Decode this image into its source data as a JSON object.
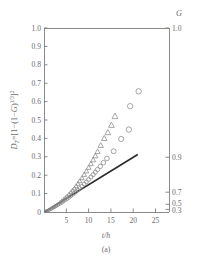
{
  "figure": {
    "caption": "(a)",
    "right_axis_title": "G",
    "xlabel": "t/h",
    "ylabel_parts": {
      "dt": "D",
      "dt_sub": "T",
      "eq": "=[1−(1−",
      "g": "G",
      "close": ")",
      "exp": "1/3",
      "tail": "]",
      "sq": "2"
    },
    "ylabel_plain": "D_T=[1-(1-G)^1/3]^2"
  },
  "chart_data": {
    "type": "scatter",
    "title": "",
    "subtitle": "",
    "caption": "(a)",
    "xlabel": "t/h",
    "ylabel": "D_T=[1-(1-G)^1/3]^2",
    "ylabel_right": "G",
    "grid": false,
    "legend": "none",
    "xlim": [
      0,
      28
    ],
    "ylim": [
      0,
      1.0
    ],
    "xticks": [
      5,
      10,
      15,
      20,
      25
    ],
    "xtick_labels": [
      "5",
      "10",
      "15",
      "20",
      "25"
    ],
    "yticks": [
      0,
      0.1,
      0.2,
      0.3,
      0.4,
      0.5,
      0.6,
      0.7,
      0.8,
      0.9,
      1.0
    ],
    "ytick_labels": [
      "0",
      "0.1",
      "0.2",
      "0.3",
      "0.4",
      "0.5",
      "0.6",
      "0.7",
      "0.8",
      "0.9",
      "1.0"
    ],
    "right_axis": {
      "label": "G",
      "tick_labels": [
        "1.0",
        "0.9",
        "0.7",
        "0.5",
        "0.3"
      ],
      "tick_G_values": [
        1.0,
        0.9,
        0.7,
        0.5,
        0.3
      ],
      "tick_DT_values": [
        1.0,
        0.2977,
        0.1077,
        0.0416,
        0.0142
      ],
      "note": "right axis is nonlinear: DT = [1-(1-G)^(1/3)]^2"
    },
    "series": [
      {
        "name": "triangles",
        "marker": "triangle-up",
        "filled": false,
        "color": "#8a8a8a",
        "points": [
          [
            0.4,
            0.004
          ],
          [
            0.8,
            0.008
          ],
          [
            1.2,
            0.013
          ],
          [
            1.6,
            0.019
          ],
          [
            2.0,
            0.025
          ],
          [
            2.4,
            0.031
          ],
          [
            2.8,
            0.038
          ],
          [
            3.2,
            0.045
          ],
          [
            3.6,
            0.053
          ],
          [
            4.0,
            0.061
          ],
          [
            4.4,
            0.069
          ],
          [
            4.8,
            0.078
          ],
          [
            5.2,
            0.087
          ],
          [
            5.6,
            0.097
          ],
          [
            6.0,
            0.107
          ],
          [
            6.4,
            0.118
          ],
          [
            6.8,
            0.129
          ],
          [
            7.2,
            0.141
          ],
          [
            7.6,
            0.154
          ],
          [
            8.0,
            0.168
          ],
          [
            8.5,
            0.185
          ],
          [
            9.0,
            0.203
          ],
          [
            9.5,
            0.222
          ],
          [
            10.0,
            0.242
          ],
          [
            10.5,
            0.262
          ],
          [
            11.0,
            0.283
          ],
          [
            11.5,
            0.305
          ],
          [
            12.0,
            0.328
          ],
          [
            12.7,
            0.362
          ],
          [
            13.5,
            0.4
          ],
          [
            14.3,
            0.432
          ],
          [
            15.1,
            0.472
          ],
          [
            15.9,
            0.52
          ]
        ]
      },
      {
        "name": "circles",
        "marker": "circle",
        "filled": false,
        "color": "#8a8a8a",
        "points": [
          [
            0.4,
            0.003
          ],
          [
            0.8,
            0.007
          ],
          [
            1.2,
            0.011
          ],
          [
            1.6,
            0.016
          ],
          [
            2.0,
            0.021
          ],
          [
            2.4,
            0.026
          ],
          [
            2.8,
            0.032
          ],
          [
            3.2,
            0.038
          ],
          [
            3.6,
            0.044
          ],
          [
            4.0,
            0.05
          ],
          [
            4.4,
            0.057
          ],
          [
            4.8,
            0.064
          ],
          [
            5.2,
            0.071
          ],
          [
            5.6,
            0.078
          ],
          [
            6.0,
            0.086
          ],
          [
            6.4,
            0.094
          ],
          [
            6.8,
            0.102
          ],
          [
            7.2,
            0.11
          ],
          [
            7.6,
            0.119
          ],
          [
            8.0,
            0.128
          ],
          [
            8.5,
            0.14
          ],
          [
            9.0,
            0.152
          ],
          [
            9.5,
            0.164
          ],
          [
            10.0,
            0.177
          ],
          [
            10.5,
            0.19
          ],
          [
            11.0,
            0.203
          ],
          [
            11.5,
            0.217
          ],
          [
            12.0,
            0.231
          ],
          [
            12.6,
            0.248
          ],
          [
            13.3,
            0.268
          ],
          [
            14.1,
            0.291
          ],
          [
            15.6,
            0.33
          ],
          [
            17.3,
            0.397
          ],
          [
            19.0,
            0.448
          ],
          [
            19.3,
            0.575
          ],
          [
            21.2,
            0.656
          ]
        ]
      }
    ],
    "fit_line": {
      "name": "model-line",
      "style": "solid",
      "color": "#2b2b2b",
      "x": [
        0.2,
        21.0
      ],
      "y": [
        0.002,
        0.312
      ]
    }
  }
}
